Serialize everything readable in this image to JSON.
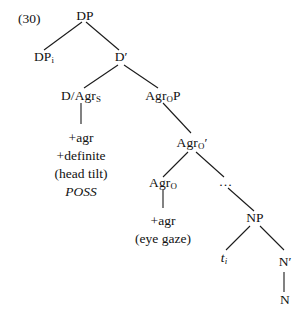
{
  "figure": {
    "example_number": "(30)",
    "background_color": "#ffffff",
    "line_color": "#1a1a1a",
    "text_color": "#111111"
  },
  "nodes": {
    "dp_root": "DP",
    "dp_spec": "DP",
    "dp_spec_sub": "i",
    "d_bar": "D′",
    "d_agrs": "D/Agr",
    "d_agrs_sub": "S",
    "agrop": "Agr",
    "agrop_sub": "O",
    "agrop_tail": "P",
    "agro_bar": "Agr",
    "agro_bar_sub": "O",
    "agro_bar_prime": "′",
    "agro_head": "Agr",
    "agro_head_sub": "O",
    "ellipsis": "…",
    "np": "NP",
    "trace": "t",
    "trace_sub": "i",
    "n_bar": "N′",
    "n": "N"
  },
  "feature_blocks": {
    "d_agrs_features": [
      "+agr",
      "+definite",
      "(head tilt)",
      "POSS"
    ],
    "d_agrs_italic_index": 3,
    "agro_features": [
      "+agr",
      "(eye gaze)"
    ]
  }
}
